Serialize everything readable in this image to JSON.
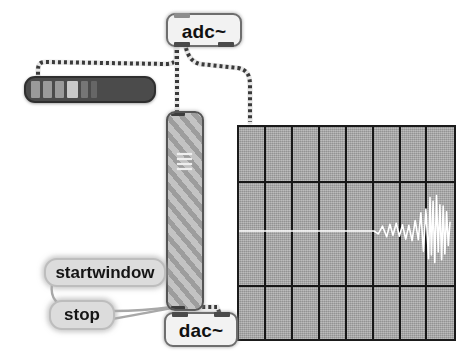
{
  "app": {
    "name": "Pure Data patch",
    "background_color": "#ffffff"
  },
  "objects": {
    "adc": {
      "label": "adc~",
      "type": "object-box",
      "x": 166,
      "y": 13,
      "w": 72,
      "h": 30,
      "inlets": 0,
      "outlets": 2,
      "fill_color": "#f2f2f2",
      "border_color": "#6e6e6e"
    },
    "dac": {
      "label": "dac~",
      "type": "object-box",
      "x": 164,
      "y": 312,
      "w": 70,
      "h": 31,
      "inlets": 2,
      "outlets": 0,
      "fill_color": "#f2f2f2",
      "border_color": "#6e6e6e"
    },
    "startwindow": {
      "label": "startwindow",
      "type": "message-box",
      "x": 44,
      "y": 258,
      "w": 118,
      "h": 25,
      "fill_color": "#dcdcdc"
    },
    "stop": {
      "label": "stop",
      "type": "message-box",
      "x": 49,
      "y": 300,
      "w": 62,
      "h": 26,
      "fill_color": "#dcdcdc"
    },
    "hmeter": {
      "name": "horizontal-level-meter",
      "type": "slider",
      "x": 24,
      "y": 76,
      "w": 128,
      "h": 23,
      "fill_color": "#4b4b4b",
      "segment_color": "#9a9a9a",
      "highlight_color": "#c9c9c9",
      "segments": 6,
      "level_percent": 36
    },
    "vobj": {
      "name": "vertical-striped-subpatch",
      "type": "canvas-object",
      "x": 166,
      "y": 111,
      "w": 34,
      "h": 196,
      "stripe_light": "#c3c3c3",
      "stripe_dark": "#9d9d9d",
      "tick_rows": 4
    }
  },
  "graph": {
    "name": "signal-array-graph",
    "x": 237,
    "y": 125,
    "w": 215,
    "h": 212,
    "fill_color": "#a6a6a6",
    "grid_color": "#171717",
    "trace_color": "#ffffff",
    "columns": 8,
    "rows": 3,
    "v_gridlines": 7,
    "h_gridlines": 2,
    "baseline_y_percent": 50
  },
  "chart_data": {
    "type": "line",
    "title": "",
    "xlabel": "",
    "ylabel": "",
    "xlim": [
      0,
      1
    ],
    "ylim": [
      -1,
      1
    ],
    "grid": true,
    "legend": null,
    "trace_color": "#ffffff",
    "background": "#a6a6a6",
    "x": [
      0.0,
      0.04,
      0.08,
      0.12,
      0.16,
      0.2,
      0.24,
      0.28,
      0.32,
      0.36,
      0.4,
      0.44,
      0.48,
      0.52,
      0.56,
      0.6,
      0.64,
      0.66,
      0.68,
      0.7,
      0.715,
      0.73,
      0.745,
      0.76,
      0.775,
      0.79,
      0.805,
      0.82,
      0.835,
      0.85,
      0.862,
      0.874,
      0.886,
      0.898,
      0.905,
      0.912,
      0.92,
      0.928,
      0.936,
      0.944,
      0.952,
      0.96,
      0.968,
      0.976,
      0.984,
      0.992,
      1.0
    ],
    "y": [
      0.0,
      0.0,
      0.0,
      0.0,
      0.0,
      0.0,
      0.0,
      0.0,
      0.0,
      0.0,
      0.0,
      0.0,
      0.0,
      0.0,
      0.0,
      0.0,
      0.0,
      -0.06,
      0.1,
      -0.12,
      0.14,
      -0.09,
      0.16,
      -0.11,
      0.13,
      -0.17,
      0.12,
      -0.2,
      0.22,
      -0.18,
      0.38,
      -0.42,
      0.46,
      -0.58,
      0.7,
      -0.5,
      0.62,
      -0.66,
      0.74,
      -0.44,
      0.55,
      -0.6,
      0.52,
      -0.48,
      0.4,
      -0.3,
      0.18
    ]
  },
  "connections": [
    {
      "name": "adc-left-out-to-hmeter",
      "kind": "signal"
    },
    {
      "name": "adc-left-out-to-vobj-in",
      "kind": "signal"
    },
    {
      "name": "adc-right-out-to-graph",
      "kind": "signal"
    },
    {
      "name": "vobj-out-to-dac-left-in",
      "kind": "signal"
    },
    {
      "name": "vobj-out-to-dac-right-in",
      "kind": "signal"
    },
    {
      "name": "startwindow-to-dac-area",
      "kind": "message"
    },
    {
      "name": "stop-to-dac-area",
      "kind": "message"
    }
  ]
}
